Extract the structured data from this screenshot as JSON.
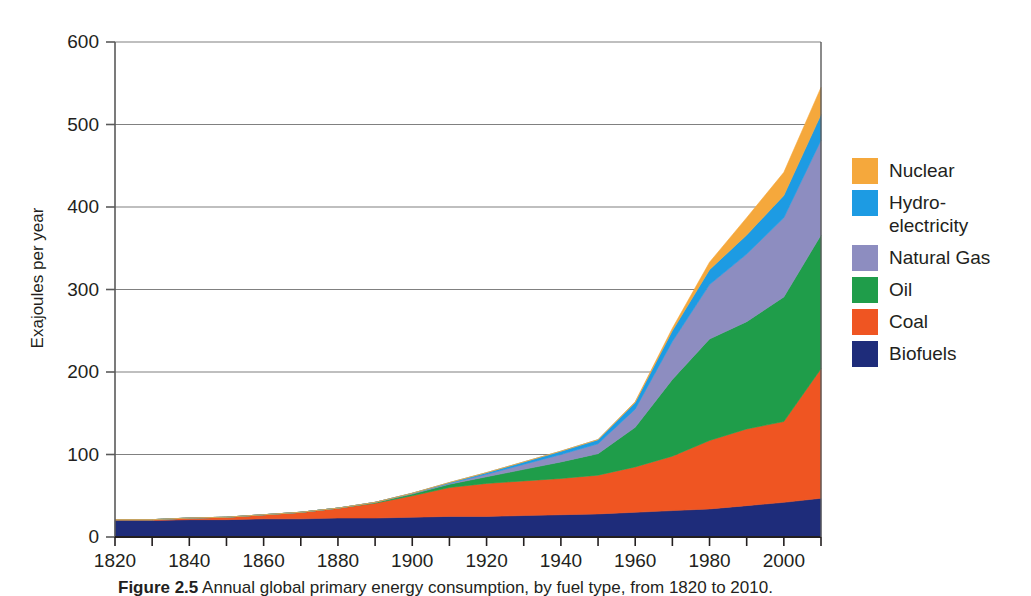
{
  "figure": {
    "caption_label": "Figure 2.5",
    "caption_text": "Annual global primary energy consumption, by fuel type, from 1820 to 2010."
  },
  "axes": {
    "y_title": "Exajoules per year",
    "y_ticks": [
      0,
      100,
      200,
      300,
      400,
      500,
      600
    ],
    "y_tick_labels": [
      "0",
      "100",
      "200",
      "300",
      "400",
      "500",
      "600"
    ],
    "x_tick_labels": [
      "1820",
      "1840",
      "1860",
      "1880",
      "1900",
      "1920",
      "1940",
      "1960",
      "1980",
      "2000"
    ],
    "x_minor_ticks": [
      1820,
      1830,
      1840,
      1850,
      1860,
      1870,
      1880,
      1890,
      1900,
      1910,
      1920,
      1930,
      1940,
      1950,
      1960,
      1970,
      1980,
      1990,
      2000,
      2010
    ],
    "x_range": [
      1820,
      2010
    ],
    "y_range": [
      0,
      600
    ],
    "grid": "horizontal"
  },
  "legend": {
    "position": "right",
    "items": [
      {
        "label": "Nuclear",
        "color": "#F5A83C"
      },
      {
        "label": "Hydro-\nelectricity",
        "label_line1": "Hydro-",
        "label_line2": "electricity",
        "color": "#1D9BE3"
      },
      {
        "label": "Natural Gas",
        "color": "#8D8DC0"
      },
      {
        "label": "Oil",
        "color": "#1F9D4A"
      },
      {
        "label": "Coal",
        "color": "#EF5522"
      },
      {
        "label": "Biofuels",
        "color": "#1E2C7A"
      }
    ]
  },
  "chart_data": {
    "type": "area",
    "stacked": true,
    "title": "",
    "xlabel": "",
    "ylabel": "Exajoules per year",
    "xlim": [
      1820,
      2010
    ],
    "ylim": [
      0,
      600
    ],
    "x": [
      1820,
      1830,
      1840,
      1850,
      1860,
      1870,
      1880,
      1890,
      1900,
      1910,
      1920,
      1930,
      1940,
      1950,
      1960,
      1970,
      1980,
      1990,
      2000,
      2010
    ],
    "series": [
      {
        "name": "Biofuels",
        "color": "#1E2C7A",
        "values": [
          20,
          20,
          21,
          21,
          22,
          22,
          23,
          23,
          24,
          25,
          25,
          26,
          27,
          28,
          30,
          32,
          34,
          38,
          42,
          47
        ]
      },
      {
        "name": "Coal",
        "color": "#EF5522",
        "values": [
          1,
          1,
          2,
          3,
          5,
          8,
          12,
          18,
          26,
          35,
          40,
          42,
          44,
          47,
          55,
          66,
          83,
          93,
          98,
          157
        ]
      },
      {
        "name": "Oil",
        "color": "#1F9D4A",
        "values": [
          0,
          0,
          0,
          0,
          0,
          0,
          0,
          1,
          2,
          4,
          8,
          14,
          20,
          26,
          48,
          93,
          123,
          130,
          151,
          162
        ]
      },
      {
        "name": "Natural Gas",
        "color": "#8D8DC0",
        "values": [
          0,
          0,
          0,
          0,
          0,
          0,
          0,
          0,
          1,
          1,
          3,
          6,
          9,
          12,
          22,
          46,
          66,
          82,
          96,
          115
        ]
      },
      {
        "name": "Hydroelectricity",
        "color": "#1D9BE3",
        "values": [
          0,
          0,
          0,
          0,
          0,
          0,
          0,
          0,
          0,
          1,
          2,
          3,
          4,
          5,
          8,
          13,
          18,
          23,
          27,
          31
        ]
      },
      {
        "name": "Nuclear",
        "color": "#F5A83C",
        "values": [
          0,
          0,
          0,
          0,
          0,
          0,
          0,
          0,
          0,
          0,
          0,
          0,
          0,
          0,
          1,
          3,
          9,
          21,
          28,
          33
        ]
      }
    ],
    "totals": [
      21,
      21,
      23,
      24,
      27,
      30,
      35,
      42,
      53,
      66,
      78,
      91,
      104,
      118,
      164,
      253,
      333,
      387,
      442,
      545
    ]
  }
}
